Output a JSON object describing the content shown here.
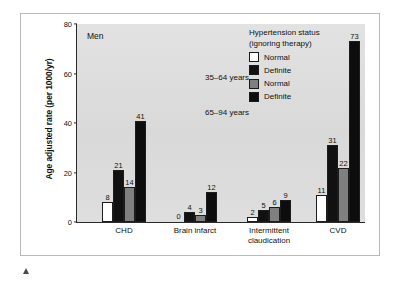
{
  "chart_data": {
    "type": "bar",
    "title": "Men",
    "xlabel": "",
    "ylabel": "Age adjusted rate (per 1000/yr)",
    "ylim": [
      0,
      80
    ],
    "yticks": [
      0,
      20,
      40,
      60,
      80
    ],
    "grid": false,
    "legend_position": "top-right",
    "legend_title_lines": [
      "Hypertension status",
      "(ignoring therapy)"
    ],
    "group_labels": [
      "35–64 years",
      "65–94 years"
    ],
    "categories": [
      "CHD",
      "Brain infarct",
      "Intermittent claudication",
      "CVD"
    ],
    "category_lines": [
      [
        "CHD"
      ],
      [
        "Brain infarct"
      ],
      [
        "Intermittent",
        "claudication"
      ],
      [
        "CVD"
      ]
    ],
    "series": [
      {
        "name": "Normal",
        "age_group": "35–64 years",
        "color": "#ffffff",
        "values": [
          8,
          0,
          2,
          11
        ]
      },
      {
        "name": "Definite",
        "age_group": "35–64 years",
        "color": "#111111",
        "values": [
          21,
          4,
          5,
          31
        ]
      },
      {
        "name": "Normal",
        "age_group": "65–94 years",
        "color": "#808080",
        "values": [
          14,
          3,
          6,
          22
        ]
      },
      {
        "name": "Definite",
        "age_group": "65–94 years",
        "color": "#0d0d0d",
        "values": [
          41,
          12,
          9,
          73
        ]
      }
    ]
  },
  "figure": {
    "plot_background": "#dcdcdc",
    "axis_color": "#2a2a2a",
    "frame_color": "#b9b9b9",
    "marker": "footnote-triangle"
  }
}
